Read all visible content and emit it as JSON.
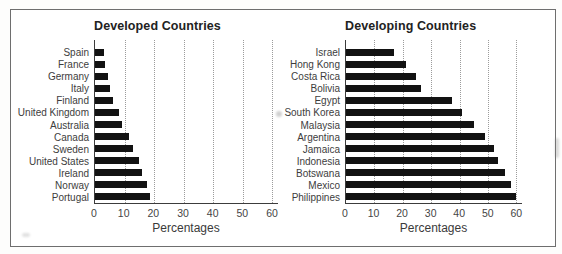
{
  "figure": {
    "background": "#ffffff",
    "frame_color": "#6e6e6e",
    "text_color": "#3d3d3d"
  },
  "chart_data": [
    {
      "type": "bar",
      "orientation": "horizontal",
      "title": "Developed Countries",
      "xlabel": "Percentages",
      "categories": [
        "Spain",
        "France",
        "Germany",
        "Italy",
        "Finland",
        "United Kingdom",
        "Australia",
        "Canada",
        "Sweden",
        "United States",
        "Ireland",
        "Norway",
        "Portugal"
      ],
      "values": [
        3,
        3.5,
        4.5,
        5,
        6,
        8,
        9,
        11.5,
        13,
        15,
        16,
        17.5,
        18.5
      ],
      "xlim": [
        0,
        62
      ],
      "xticks": [
        0,
        10,
        20,
        30,
        40,
        50,
        60
      ],
      "grid": "vertical-dotted",
      "bar_color": "#121212",
      "legend": "none"
    },
    {
      "type": "bar",
      "orientation": "horizontal",
      "title": "Developing Countries",
      "xlabel": "Percentages",
      "categories": [
        "Israel",
        "Hong Kong",
        "Costa Rica",
        "Bolivia",
        "Egypt",
        "South Korea",
        "Malaysia",
        "Argentina",
        "Jamaica",
        "Indonesia",
        "Botswana",
        "Mexico",
        "Philippines"
      ],
      "values": [
        17,
        21,
        24.5,
        26.5,
        37.5,
        41,
        45,
        49,
        52,
        53.5,
        56,
        58,
        60
      ],
      "xlim": [
        0,
        62
      ],
      "xticks": [
        0,
        10,
        20,
        30,
        40,
        50,
        60
      ],
      "grid": "vertical-dotted",
      "bar_color": "#121212",
      "legend": "none"
    }
  ]
}
